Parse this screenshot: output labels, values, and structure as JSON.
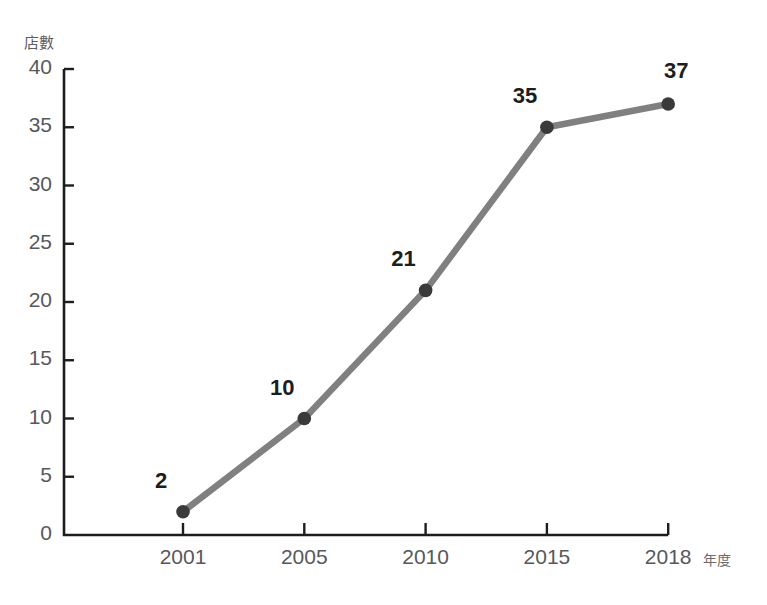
{
  "chart_data": {
    "type": "line",
    "title": "",
    "xlabel": "年度",
    "ylabel": "店數",
    "categories": [
      "2001",
      "2005",
      "2010",
      "2015",
      "2018"
    ],
    "values": [
      2,
      10,
      21,
      35,
      37
    ],
    "point_labels": [
      "2",
      "10",
      "21",
      "35",
      "37"
    ],
    "ylim": [
      0,
      40
    ],
    "y_ticks": [
      "0",
      "5",
      "10",
      "15",
      "20",
      "25",
      "30",
      "35",
      "40"
    ],
    "grid": false,
    "legend": "none",
    "series": [
      {
        "name": "店數",
        "values": [
          2,
          10,
          21,
          35,
          37
        ]
      }
    ],
    "colors": {
      "line": "#808080",
      "marker": "#3a3a3a",
      "axis": "#1d1d1d",
      "tick_label": "#58585a",
      "point_label": "#1d1d1d",
      "axis_title": "#5d5d5f",
      "background": "#ffffff"
    }
  }
}
